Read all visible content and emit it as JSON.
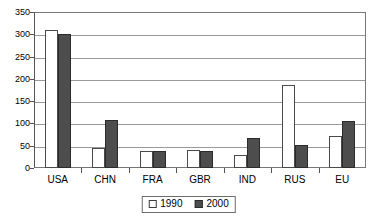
{
  "chart_data": {
    "type": "bar",
    "title": "",
    "subtitle": "",
    "xlabel": "",
    "ylabel": "",
    "categories": [
      "USA",
      "CHN",
      "FRA",
      "GBR",
      "IND",
      "RUS",
      "EU"
    ],
    "series": [
      {
        "name": "1990",
        "color": "#ffffff",
        "values": [
          310,
          45,
          38,
          41,
          30,
          187,
          72
        ]
      },
      {
        "name": "2000",
        "color": "#4d4d4d",
        "values": [
          300,
          107,
          39,
          38,
          68,
          52,
          105
        ]
      }
    ],
    "ylim": [
      0,
      350
    ],
    "ytick_step": 50,
    "yticks": [
      "350",
      "300",
      "250",
      "200",
      "150",
      "100",
      "50",
      "0"
    ],
    "grid": true,
    "legend_position": "bottom",
    "legend": [
      {
        "label": "1990",
        "swatch": "open-square"
      },
      {
        "label": "2000",
        "swatch": "filled-square"
      }
    ]
  },
  "colors": {
    "series_1990": "#ffffff",
    "series_2000": "#4d4d4d",
    "grid": "#9a9a9a",
    "axis": "#555555",
    "text": "#000000",
    "background": "#ffffff"
  }
}
